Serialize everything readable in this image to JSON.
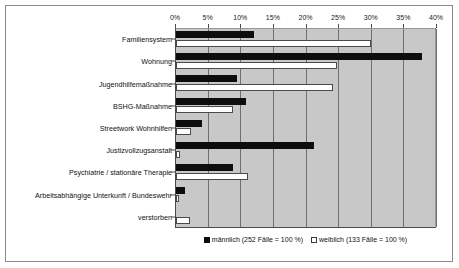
{
  "chart_data": {
    "type": "bar",
    "orientation": "horizontal",
    "title": "",
    "xlabel": "",
    "ylabel": "",
    "xlim": [
      0,
      40
    ],
    "xunit": "%",
    "grid": true,
    "legend_position": "bottom",
    "tick_labels": [
      "0%",
      "5%",
      "10%",
      "15%",
      "20%",
      "25%",
      "30%",
      "35%",
      "40%"
    ],
    "tick_values": [
      0,
      5,
      10,
      15,
      20,
      25,
      30,
      35,
      40
    ],
    "categories": [
      "Familiensystem",
      "Wohnung",
      "Jugendhilfemaßnahme",
      "BSHG-Maßnahme",
      "Streetwork Wohnhilfen",
      "Justizvollzugsanstalt",
      "Psychiatrie / stationäre Therapie",
      "Arbeitsabhängige Unterkunft / Bundeswehr",
      "verstorben"
    ],
    "series": [
      {
        "name": "männlich (252 Fälle = 100 %)",
        "short_name": "männlich",
        "color": "#0d0d0d",
        "values": [
          11.9,
          37.7,
          9.3,
          10.7,
          4.0,
          21.2,
          8.8,
          1.4,
          0.0
        ]
      },
      {
        "name": "weiblich (133 Fälle = 100 %)",
        "short_name": "weiblich",
        "color": "#ffffff",
        "values": [
          29.9,
          24.7,
          24.0,
          8.8,
          2.3,
          0.6,
          11.0,
          0.5,
          2.1
        ]
      }
    ]
  },
  "legend": {
    "items": [
      {
        "label": "männlich (252 Fälle = 100 %)"
      },
      {
        "label": "weiblich (133 Fälle = 100 %)"
      }
    ]
  },
  "colors": {
    "plot_background": "#c8c8c8",
    "gridline": "#6f6f6f",
    "axis": "#4a4a4a",
    "frame": "#8a8a8a",
    "male_bar": "#0d0d0d",
    "female_bar": "#ffffff"
  }
}
